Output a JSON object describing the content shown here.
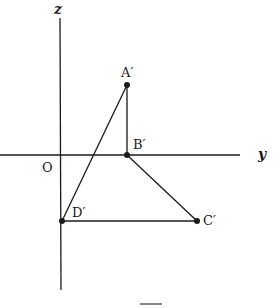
{
  "diagram": {
    "axes": {
      "vertical_label": "z",
      "horizontal_label": "y",
      "origin_label": "O"
    },
    "points": [
      {
        "id": "A",
        "label": "A′",
        "x": 127,
        "y": 85
      },
      {
        "id": "B",
        "label": "B′",
        "x": 127,
        "y": 155
      },
      {
        "id": "C",
        "label": "C′",
        "x": 197,
        "y": 221
      },
      {
        "id": "D",
        "label": "D′",
        "x": 62,
        "y": 221
      }
    ],
    "segments": [
      [
        "A",
        "B"
      ],
      [
        "B",
        "C"
      ],
      [
        "C",
        "D"
      ],
      [
        "D",
        "A"
      ]
    ],
    "colors": {
      "line": "#1a1a1a",
      "background": "#ffffff"
    }
  }
}
